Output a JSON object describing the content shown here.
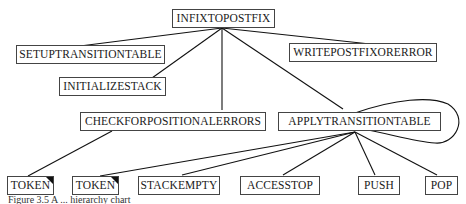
{
  "diagram": {
    "nodes": [
      {
        "id": "infixtopostfix",
        "label": "INFIXTOPOSTFIX"
      },
      {
        "id": "setuptransitiontable",
        "label": "SETUPTRANSITIONTABLE"
      },
      {
        "id": "writepostfixorerror",
        "label": "WRITEPOSTFIXORERROR"
      },
      {
        "id": "initializestack",
        "label": "INITIALIZESTACK"
      },
      {
        "id": "checkforpositionalerrors",
        "label": "CHECKFORPOSITIONALERRORS"
      },
      {
        "id": "applytransitiontable",
        "label": "APPLYTRANSITIONTABLE"
      },
      {
        "id": "token1",
        "label": "TOKEN"
      },
      {
        "id": "token2",
        "label": "TOKEN"
      },
      {
        "id": "stackempty",
        "label": "STACKEMPTY"
      },
      {
        "id": "accesstop",
        "label": "ACCESSTOP"
      },
      {
        "id": "push",
        "label": "PUSH"
      },
      {
        "id": "pop",
        "label": "POP"
      }
    ],
    "edges": [
      [
        "infixtopostfix",
        "setuptransitiontable"
      ],
      [
        "infixtopostfix",
        "writepostfixorerror"
      ],
      [
        "infixtopostfix",
        "initializestack"
      ],
      [
        "infixtopostfix",
        "checkforpositionalerrors"
      ],
      [
        "infixtopostfix",
        "applytransitiontable"
      ],
      [
        "applytransitiontable",
        "applytransitiontable"
      ],
      [
        "checkforpositionalerrors",
        "token1"
      ],
      [
        "applytransitiontable",
        "token2"
      ],
      [
        "applytransitiontable",
        "stackempty"
      ],
      [
        "applytransitiontable",
        "accesstop"
      ],
      [
        "applytransitiontable",
        "push"
      ],
      [
        "applytransitiontable",
        "pop"
      ]
    ],
    "caption": "Figure 3.5 A ... hierarchy chart"
  }
}
